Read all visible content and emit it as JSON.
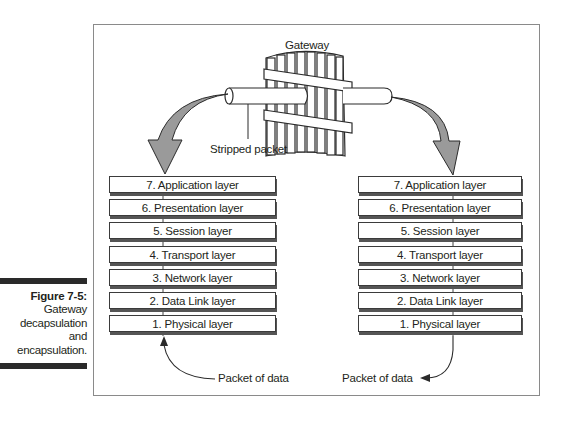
{
  "caption": {
    "figure_label": "Figure 7-5:",
    "lines": [
      "Gateway",
      "decapsulation",
      "and",
      "encapsulation."
    ]
  },
  "diagram": {
    "gateway_label": "Gateway",
    "stripped_packet_label": "Stripped packet",
    "left_stack": {
      "layers": [
        "7. Application layer",
        "6. Presentation layer",
        "5. Session layer",
        "4. Transport layer",
        "3. Network layer",
        "2. Data Link layer",
        "1. Physical layer"
      ],
      "packet_label": "Packet of data"
    },
    "right_stack": {
      "layers": [
        "7. Application layer",
        "6. Presentation layer",
        "5. Session layer",
        "4. Transport layer",
        "3. Network layer",
        "2. Data Link layer",
        "1. Physical layer"
      ],
      "packet_label": "Packet of data"
    },
    "colors": {
      "arrow_fill": "#9a9a9a",
      "line": "#2b2b2b",
      "frame": "#8a8a8a"
    }
  }
}
